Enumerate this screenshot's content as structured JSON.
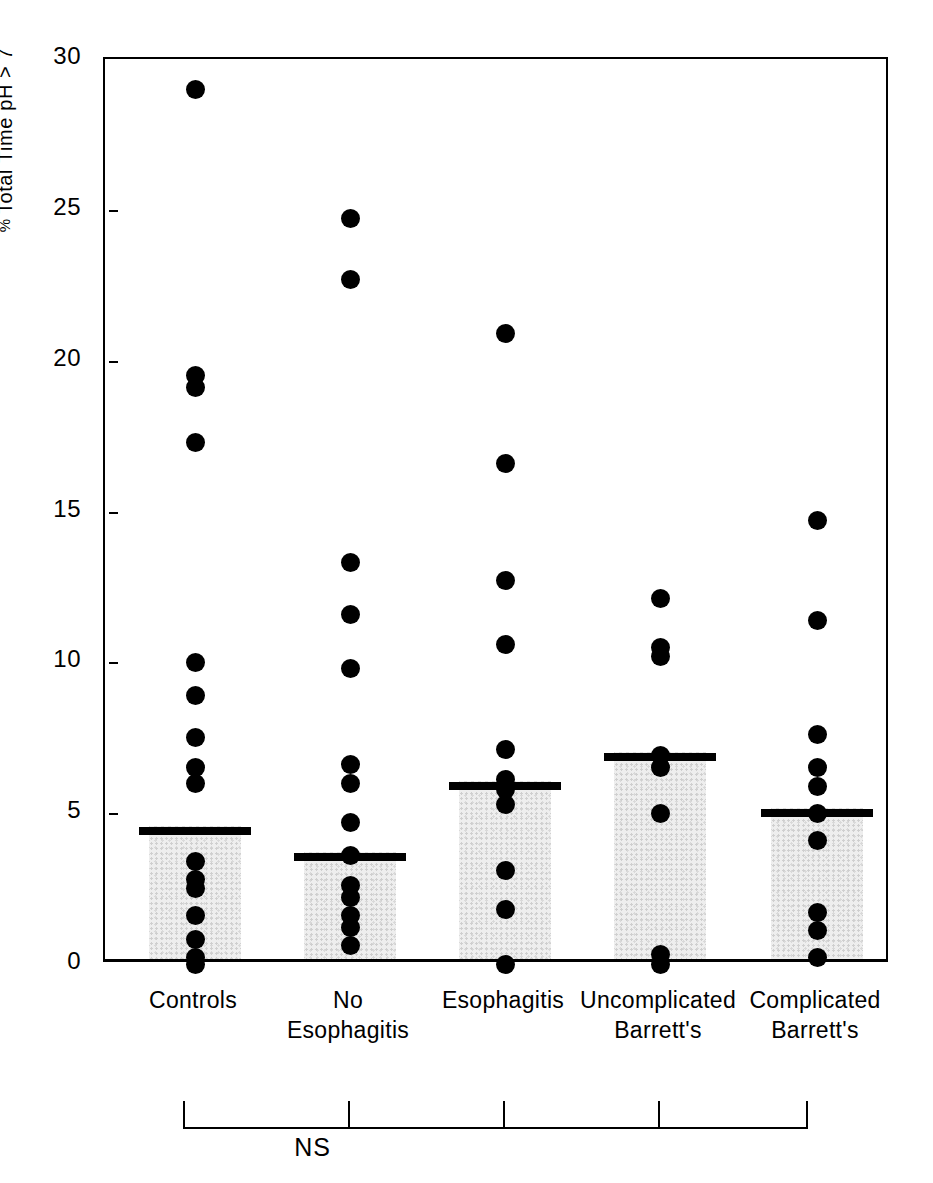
{
  "figure": {
    "background": "#ffffff",
    "marker_color": "#000000",
    "bar_fill": "#ededed",
    "axis_color": "#000000"
  },
  "axes": {
    "y_title_prefix": "%",
    "y_title": " Total Time pH > 7",
    "y_ticks": [
      0,
      5,
      10,
      15,
      20,
      25,
      30
    ],
    "y_tick_labels": [
      "0",
      "5",
      "10",
      "15",
      "20",
      "25",
      "30"
    ]
  },
  "annotation": {
    "significance_label": "NS"
  },
  "chart_data": {
    "type": "scatter",
    "title": "",
    "xlabel": "",
    "ylabel": "% Total Time pH > 7",
    "ylim": [
      0,
      30
    ],
    "grid": false,
    "legend": "none",
    "yticks": [
      0,
      5,
      10,
      15,
      20,
      25,
      30
    ],
    "annotations": [
      {
        "text": "NS",
        "spans_groups": [
          "Controls",
          "No Esophagitis",
          "Esophagitis",
          "Uncomplicated Barrett's",
          "Complicated Barrett's"
        ]
      }
    ],
    "categories": [
      "Controls",
      "No Esophagitis",
      "Esophagitis",
      "Uncomplicated Barrett's",
      "Complicated Barrett's"
    ],
    "category_label_lines": [
      [
        "Controls"
      ],
      [
        "No",
        "Esophagitis"
      ],
      [
        "Esophagitis"
      ],
      [
        "Uncomplicated",
        "Barrett's"
      ],
      [
        "Complicated",
        "Barrett's"
      ]
    ],
    "means": [
      4.4,
      3.55,
      5.9,
      6.85,
      5.0
    ],
    "mean_marker": "horizontal-bar",
    "bar_meaning": "shaded column drawn from 0 up to the group mean",
    "groups": [
      {
        "name": "Controls",
        "mean": 4.4,
        "values": [
          29.0,
          19.5,
          19.1,
          17.3,
          10.0,
          8.9,
          7.5,
          6.5,
          6.0,
          3.4,
          2.8,
          2.5,
          1.6,
          0.8,
          0.2,
          0.0
        ]
      },
      {
        "name": "No Esophagitis",
        "mean": 3.55,
        "values": [
          24.7,
          22.7,
          13.3,
          11.6,
          9.8,
          6.6,
          6.0,
          4.7,
          3.6,
          2.6,
          2.2,
          1.6,
          1.2,
          0.6
        ]
      },
      {
        "name": "Esophagitis",
        "mean": 5.9,
        "values": [
          20.9,
          16.6,
          12.7,
          10.6,
          7.1,
          6.1,
          5.8,
          5.3,
          3.1,
          1.8,
          0.0
        ]
      },
      {
        "name": "Uncomplicated Barrett's",
        "mean": 6.85,
        "values": [
          12.1,
          10.5,
          10.2,
          6.9,
          6.5,
          5.0,
          0.3,
          0.0
        ]
      },
      {
        "name": "Complicated Barrett's",
        "mean": 5.0,
        "values": [
          14.7,
          11.4,
          7.6,
          6.5,
          5.9,
          5.0,
          4.1,
          1.7,
          1.1,
          0.2
        ]
      }
    ]
  }
}
